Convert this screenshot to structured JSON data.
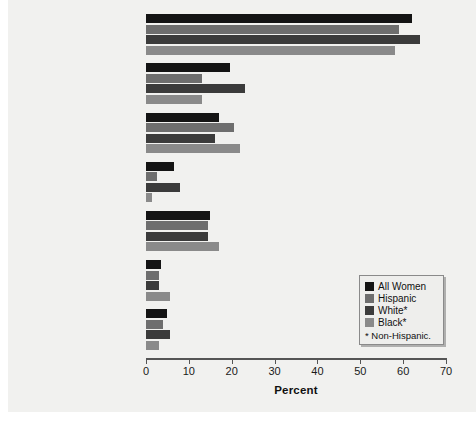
{
  "chart_data": {
    "type": "bar",
    "orientation": "horizontal",
    "title": "",
    "xlabel": "Percent",
    "ylabel": "",
    "xlim": [
      0,
      70
    ],
    "xticks": [
      0,
      10,
      20,
      30,
      40,
      50,
      60,
      70
    ],
    "grid": false,
    "legend_position": "bottom-right",
    "legend_note": "* Non-Hispanic.",
    "categories": [
      "Currently using contraception",
      "Pill",
      "Female sterilization",
      "Male sterilization",
      "Condom",
      "Three-month injectable",
      "Withdrawal"
    ],
    "category_lines": [
      [
        "Currently using",
        "contraception"
      ],
      [
        "Pill"
      ],
      [
        "Female sterilization"
      ],
      [
        "Male sterilization"
      ],
      [
        "Condom"
      ],
      [
        "Three-month injectable"
      ],
      [
        "Withdrawal"
      ]
    ],
    "series": [
      {
        "name": "All Women",
        "color": "#141414",
        "values": [
          62,
          19.5,
          17,
          6.5,
          15,
          3.5,
          5
        ]
      },
      {
        "name": "Hispanic",
        "color": "#6e6e6e",
        "values": [
          59,
          13,
          20.5,
          2.5,
          14.5,
          3,
          4
        ]
      },
      {
        "name": "White*",
        "color": "#3b3b3b",
        "values": [
          64,
          23,
          16,
          8,
          14.5,
          3,
          5.5
        ]
      },
      {
        "name": "Black*",
        "color": "#8a8a8a",
        "values": [
          58,
          13,
          22,
          1.5,
          17,
          5.5,
          3
        ]
      }
    ]
  },
  "legend": {
    "entries": [
      {
        "label": "All Women"
      },
      {
        "label": "Hispanic"
      },
      {
        "label": "White*"
      },
      {
        "label": "Black*"
      }
    ],
    "note": "* Non-Hispanic."
  },
  "axis": {
    "x_title": "Percent",
    "tick_labels": [
      "0",
      "10",
      "20",
      "30",
      "40",
      "50",
      "60",
      "70"
    ]
  }
}
